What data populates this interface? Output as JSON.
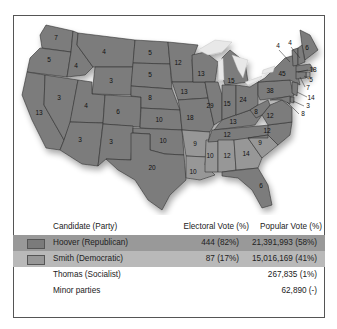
{
  "legend": {
    "headers": {
      "candidate": "Candidate (Party)",
      "electoral": "Electoral Vote (%)",
      "popular": "Popular Vote (%)"
    },
    "rows": [
      {
        "candidate": "Hoover (Republican)",
        "electoral": "444 (82%)",
        "popular": "21,391,993 (58%)",
        "color": "#7b7b7b"
      },
      {
        "candidate": "Smith (Democratic)",
        "electoral": "87 (17%)",
        "popular": "15,016,169 (41%)",
        "color": "#979797"
      },
      {
        "candidate": "Thomas (Socialist)",
        "electoral": "",
        "popular": "267,835 (1%)"
      },
      {
        "candidate": "Minor parties",
        "electoral": "",
        "popular": "62,890 (-)"
      }
    ]
  },
  "map": {
    "colors": {
      "republican": "#7b7b7b",
      "democratic": "#979797"
    },
    "labels": {
      "wa": "7",
      "or": "5",
      "ca": "13",
      "id": "4",
      "nv": "3",
      "mt": "4",
      "wy": "3",
      "ut": "4",
      "az": "3",
      "co": "6",
      "nm": "3",
      "nd": "5",
      "sd": "5",
      "ne": "8",
      "ks": "10",
      "ok": "10",
      "tx": "20",
      "mn": "12",
      "ia": "13",
      "mo": "18",
      "ar": "9",
      "la": "10",
      "wi": "13",
      "il": "29",
      "ms": "10",
      "mi": "15",
      "in": "15",
      "ky": "13",
      "tn": "12",
      "al": "12",
      "oh": "24",
      "ga": "14",
      "fl": "6",
      "sc": "9",
      "nc": "12",
      "va": "12",
      "wv": "8",
      "pa": "38",
      "ny": "45",
      "me": "6",
      "vt": "4",
      "nh": "4",
      "ma": "18",
      "ri": "5",
      "ct": "7",
      "nj": "14",
      "de": "3",
      "md": "8"
    }
  }
}
